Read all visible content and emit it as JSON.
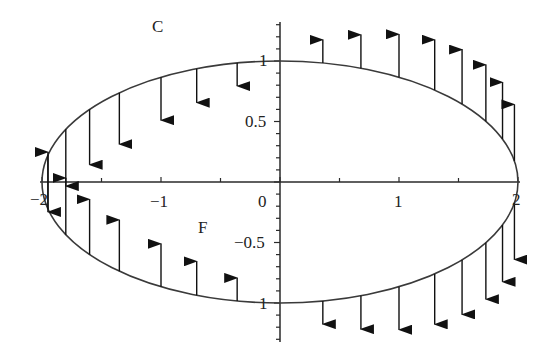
{
  "figure": {
    "curve_label": "C",
    "field_label": "F",
    "colors": {
      "curve": "#3a3a3a",
      "axes": "#2a2a2a",
      "arrows": "#111111",
      "background": "#ffffff"
    }
  },
  "axes": {
    "x_ticks": [
      {
        "value": -2,
        "label": "−2"
      },
      {
        "value": -1,
        "label": "−1"
      },
      {
        "value": 0,
        "label": "0"
      },
      {
        "value": 1,
        "label": "1"
      },
      {
        "value": 2,
        "label": "2"
      }
    ],
    "y_ticks": [
      {
        "value": 1,
        "label": "1"
      },
      {
        "value": 0.5,
        "label": "0.5"
      },
      {
        "value": -0.5,
        "label": "−0.5"
      },
      {
        "value": -1,
        "label": "1"
      }
    ],
    "x_range": [
      -2,
      2
    ],
    "y_range": [
      -1.3,
      1.3
    ]
  },
  "curve": {
    "type": "ellipse",
    "semi_major_x": 2,
    "semi_minor_y": 1
  },
  "vectors": {
    "sample_x": [
      -1.95,
      -1.8,
      -1.6,
      -1.35,
      -1.0,
      -0.7,
      -0.36,
      0.36,
      0.68,
      1.0,
      1.3,
      1.53,
      1.73,
      1.87,
      1.97
    ],
    "direction_rule": "vertical; upper-left down, upper-right up, lower-left up, lower-right down"
  }
}
